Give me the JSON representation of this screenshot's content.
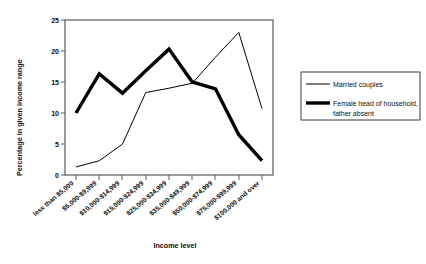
{
  "chart_data": {
    "type": "line",
    "title": "",
    "xlabel": "Income level",
    "ylabel": "Percentage in given income range",
    "ylim": [
      0,
      25
    ],
    "yticks": [
      0,
      5,
      10,
      15,
      20,
      25
    ],
    "grid": false,
    "legend_position": "right",
    "categories": [
      "less than $5,000",
      "$5,000-$9,999",
      "$10,000-$14,999",
      "$15,000-$24,999",
      "$25,000-$34,999",
      "$35,000-$49,999",
      "$50,000-$74,999",
      "$75,000-$99,999",
      "$100,000 and over"
    ],
    "series": [
      {
        "name": "Married couples",
        "style": "thin",
        "values": [
          1.3,
          2.3,
          5.0,
          13.3,
          14.0,
          14.8,
          19.0,
          23.0,
          10.7
        ]
      },
      {
        "name": "Female head of household, father absent",
        "style": "thick",
        "values": [
          10.0,
          16.3,
          13.2,
          16.8,
          20.3,
          15.0,
          13.9,
          6.5,
          2.3
        ]
      }
    ]
  },
  "legend": {
    "entries": [
      {
        "label": "Married couples"
      },
      {
        "label": "Female head of household,"
      },
      {
        "label": "father absent"
      }
    ]
  }
}
